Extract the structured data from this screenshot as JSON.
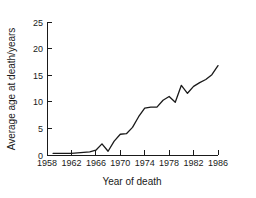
{
  "chart_data": {
    "type": "line",
    "title": "",
    "xlabel": "Year of death",
    "ylabel": "Average age at death/years",
    "xlim": [
      1958,
      1986
    ],
    "ylim": [
      0,
      25
    ],
    "xticks": [
      1958,
      1962,
      1966,
      1970,
      1974,
      1978,
      1982,
      1986
    ],
    "yticks": [
      0,
      5,
      10,
      15,
      20,
      25
    ],
    "grid": false,
    "legend": false,
    "legend_position": "none",
    "line_color": "#1a1a1a",
    "x": [
      1959,
      1960,
      1961,
      1962,
      1963,
      1964,
      1965,
      1966,
      1967,
      1968,
      1969,
      1970,
      1971,
      1972,
      1973,
      1974,
      1975,
      1976,
      1977,
      1978,
      1979,
      1980,
      1981,
      1982,
      1983,
      1984,
      1985,
      1986
    ],
    "values": [
      0.3,
      0.3,
      0.3,
      0.3,
      0.4,
      0.5,
      0.6,
      0.9,
      2.1,
      0.7,
      2.6,
      3.9,
      4.0,
      5.2,
      7.2,
      8.8,
      9.0,
      9.0,
      10.3,
      11.0,
      9.9,
      13.1,
      11.6,
      12.9,
      13.6,
      14.2,
      15.1,
      16.8
    ],
    "axis_labels": {
      "y_25": "25",
      "y_20": "20",
      "y_15": "15",
      "y_10": "10",
      "y_5": "5",
      "y_0": "0",
      "x_1958": "1958",
      "x_1962": "1962",
      "x_1966": "1966",
      "x_1970": "1970",
      "x_1974": "1974",
      "x_1978": "1978",
      "x_1982": "1982",
      "x_1986": "1986"
    }
  }
}
